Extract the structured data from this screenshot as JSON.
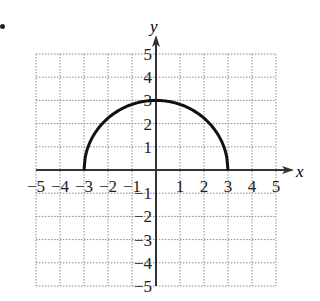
{
  "chart_data": {
    "type": "line",
    "title": "",
    "xlabel": "x",
    "ylabel": "y",
    "xlim": [
      -5,
      5
    ],
    "ylim": [
      -5,
      5
    ],
    "grid": true,
    "grid_style": "dotted",
    "x_ticks": [
      -5,
      -4,
      -3,
      -2,
      -1,
      1,
      2,
      3,
      4,
      5
    ],
    "y_ticks": [
      5,
      4,
      3,
      2,
      1,
      -1,
      -2,
      -3,
      -4,
      -5
    ],
    "x_tick_labels": [
      "−5",
      "−4",
      "−3",
      "−2",
      "−1",
      "1",
      "2",
      "3",
      "4",
      "5"
    ],
    "y_tick_labels": [
      "5",
      "4",
      "3",
      "2",
      "1",
      "−1",
      "−2",
      "−3",
      "−4",
      "−5"
    ],
    "series": [
      {
        "name": "upper semicircle",
        "equation": "y = sqrt(9 - x^2)",
        "domain": [
          -3,
          3
        ],
        "x": [
          -3,
          -2.5,
          -2,
          -1.5,
          -1,
          -0.5,
          0,
          0.5,
          1,
          1.5,
          2,
          2.5,
          3
        ],
        "y": [
          0,
          1.66,
          2.24,
          2.6,
          2.83,
          2.96,
          3,
          2.96,
          2.83,
          2.6,
          2.24,
          1.66,
          0
        ],
        "color": "#111111"
      }
    ],
    "legend": null
  },
  "colors": {
    "curve": "#111111",
    "axis": "#333333",
    "grid": "#8a8a8a"
  }
}
